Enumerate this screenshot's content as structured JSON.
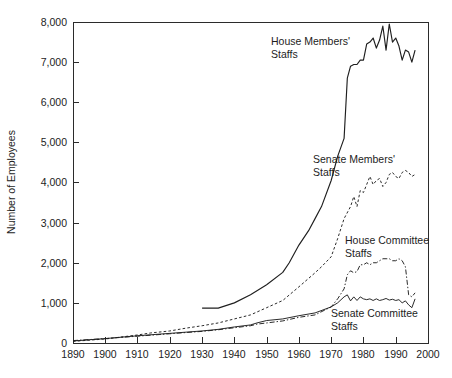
{
  "chart_data": {
    "type": "line",
    "title": "",
    "xlabel": "",
    "ylabel": "Number of Employees",
    "xlim": [
      1890,
      2000
    ],
    "ylim": [
      0,
      8000
    ],
    "grid": false,
    "legend_position": "inline-annotations",
    "xticks": [
      "1890",
      "1900",
      "1910",
      "1920",
      "1930",
      "1940",
      "1950",
      "1960",
      "1970",
      "1980",
      "1990",
      "2000"
    ],
    "yticks": [
      "0",
      "1,000",
      "2,000",
      "3,000",
      "4,000",
      "5,000",
      "6,000",
      "7,000",
      "8,000"
    ],
    "series": [
      {
        "name": "House Members' Staffs",
        "label_line1": "House Members'",
        "label_line2": "Staffs",
        "style": "solid",
        "x": [
          1930,
          1935,
          1940,
          1945,
          1950,
          1955,
          1957,
          1960,
          1963,
          1965,
          1967,
          1970,
          1972,
          1974,
          1975,
          1976,
          1977,
          1978,
          1979,
          1980,
          1981,
          1982,
          1983,
          1984,
          1985,
          1986,
          1987,
          1988,
          1989,
          1990,
          1991,
          1992,
          1993,
          1994,
          1995,
          1996
        ],
        "values": [
          870,
          870,
          1000,
          1200,
          1450,
          1760,
          2000,
          2440,
          2800,
          3100,
          3400,
          4050,
          4650,
          5100,
          6600,
          6900,
          6940,
          6940,
          7050,
          7050,
          7450,
          7500,
          7600,
          7350,
          7550,
          7900,
          7300,
          7950,
          7500,
          7600,
          7400,
          7050,
          7300,
          7250,
          7000,
          7300
        ]
      },
      {
        "name": "Senate Members' Staffs",
        "label_line1": "Senate Members'",
        "label_line2": "Staffs",
        "style": "dashed",
        "x": [
          1890,
          1900,
          1910,
          1914,
          1920,
          1925,
          1930,
          1935,
          1940,
          1945,
          1950,
          1955,
          1960,
          1965,
          1967,
          1970,
          1972,
          1974,
          1976,
          1977,
          1978,
          1979,
          1980,
          1981,
          1982,
          1983,
          1984,
          1985,
          1986,
          1987,
          1988,
          1989,
          1990,
          1991,
          1992,
          1993,
          1994,
          1995,
          1996
        ],
        "values": [
          40,
          100,
          200,
          250,
          300,
          370,
          430,
          500,
          600,
          700,
          880,
          1060,
          1400,
          1750,
          1900,
          2150,
          2600,
          3100,
          3400,
          3650,
          3400,
          3800,
          3750,
          3950,
          4150,
          3950,
          4050,
          4100,
          3900,
          4000,
          4200,
          4250,
          4150,
          4100,
          4250,
          4300,
          4250,
          4150,
          4200
        ]
      },
      {
        "name": "House Committee Staffs",
        "label_line1": "House Committee",
        "label_line2": "Staffs",
        "style": "dashdot",
        "x": [
          1890,
          1900,
          1910,
          1920,
          1930,
          1935,
          1940,
          1945,
          1947,
          1950,
          1955,
          1960,
          1965,
          1970,
          1972,
          1974,
          1975,
          1976,
          1977,
          1978,
          1979,
          1980,
          1981,
          1982,
          1983,
          1984,
          1985,
          1986,
          1987,
          1988,
          1989,
          1990,
          1991,
          1992,
          1993,
          1994,
          1995,
          1996
        ],
        "values": [
          60,
          110,
          170,
          230,
          290,
          330,
          380,
          430,
          470,
          500,
          550,
          640,
          700,
          900,
          1100,
          1350,
          1700,
          1800,
          1750,
          1780,
          1950,
          1950,
          2000,
          1950,
          2000,
          2000,
          2050,
          2100,
          2100,
          2100,
          2050,
          2050,
          2100,
          2050,
          1900,
          1200,
          1150,
          1250
        ]
      },
      {
        "name": "Senate Committee Staffs",
        "label_line1": "Senate Committee",
        "label_line2": "Staffs",
        "style": "solid-thin",
        "x": [
          1890,
          1900,
          1910,
          1920,
          1930,
          1935,
          1940,
          1945,
          1947,
          1950,
          1955,
          1960,
          1965,
          1970,
          1972,
          1974,
          1975,
          1976,
          1977,
          1978,
          1979,
          1980,
          1981,
          1982,
          1983,
          1984,
          1985,
          1986,
          1987,
          1988,
          1989,
          1990,
          1991,
          1992,
          1993,
          1994,
          1995,
          1996
        ],
        "values": [
          50,
          110,
          180,
          240,
          300,
          340,
          400,
          450,
          500,
          560,
          600,
          680,
          750,
          900,
          1000,
          1150,
          1200,
          1050,
          1150,
          1060,
          1150,
          1100,
          1080,
          1100,
          1060,
          1100,
          1060,
          1080,
          1110,
          1070,
          1090,
          1060,
          1080,
          1000,
          1050,
          950,
          880,
          1100
        ]
      }
    ],
    "annotations": [
      {
        "name": "house-members-label",
        "line1": "House Members'",
        "line2": "Staffs"
      },
      {
        "name": "senate-members-label",
        "line1": "Senate Members'",
        "line2": "Staffs"
      },
      {
        "name": "house-committee-label",
        "line1": "House Committee",
        "line2": "Staffs"
      },
      {
        "name": "senate-committee-label",
        "line1": "Senate Committee",
        "line2": "Staffs"
      }
    ]
  },
  "colors": {
    "background": "#ffffff",
    "ink": "#1f1f1f",
    "axis": "#2b2b2b"
  }
}
